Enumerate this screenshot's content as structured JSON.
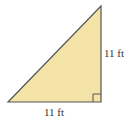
{
  "figure": {
    "shape": "right-triangle",
    "fill_color": "#f3e3a6",
    "stroke_color": "#555555",
    "vertices": {
      "bottom_left": [
        8,
        102
      ],
      "bottom_right": [
        101,
        102
      ],
      "top": [
        101,
        6
      ]
    },
    "right_angle_marker": {
      "corner": "bottom-right",
      "size": 8
    },
    "labels": {
      "vertical_side": "11 ft",
      "horizontal_side": "11 ft"
    }
  }
}
